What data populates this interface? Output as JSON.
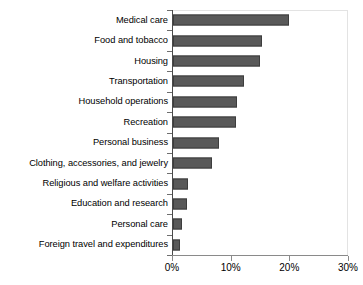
{
  "chart_data": {
    "type": "bar",
    "orientation": "horizontal",
    "title": "",
    "subtitle": "",
    "xlabel": "",
    "ylabel": "",
    "categories": [
      "Medical care",
      "Food and tobacco",
      "Housing",
      "Transportation",
      "Household operations",
      "Recreation",
      "Personal business",
      "Clothing, accessories, and jewelry",
      "Religious and welfare activities",
      "Education and research",
      "Personal care",
      "Foreign travel and expenditures"
    ],
    "values": [
      19.8,
      15.2,
      14.8,
      12.1,
      10.9,
      10.7,
      7.8,
      6.7,
      2.6,
      2.4,
      1.5,
      1.2
    ],
    "value_unit": "%",
    "xlim": [
      0,
      30
    ],
    "xticks": [
      0,
      10,
      20,
      30
    ],
    "xtick_labels": [
      "0%",
      "10%",
      "20%",
      "30%"
    ],
    "grid": false,
    "legend": false,
    "bar_color": "#595959",
    "bar_edge_color": "#3d3d3d",
    "axis_color": "#4a4a4a",
    "frame_color": "#e3e3e3",
    "background": "#ffffff"
  }
}
